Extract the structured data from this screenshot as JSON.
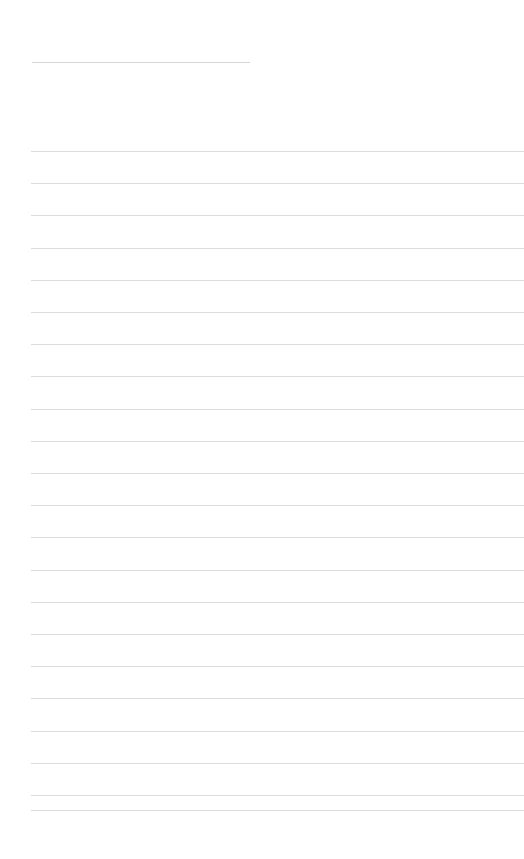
{
  "document": {
    "page_background": "#ffffff",
    "page_width": 524,
    "page_height": 859,
    "title_text": "",
    "body_text": "",
    "heading_rule": {
      "name": "heading-underline-rule",
      "x": 32,
      "y": 62,
      "width": 218,
      "color": "#d4d6da",
      "thickness": 1
    },
    "body_rules": {
      "name": "body-ruled-lines",
      "count": 22,
      "x_start": 31,
      "x_end": 524,
      "first_y": 151,
      "spacing": 32.2,
      "color": "#dadcdf",
      "thickness": 1,
      "y_positions": [
        151,
        183.2,
        215.4,
        247.6,
        279.8,
        312,
        344.2,
        376.4,
        408.6,
        440.8,
        473,
        505.2,
        537.4,
        569.6,
        601.8,
        634,
        666.2,
        698.4,
        730.6,
        762.8,
        795,
        810
      ]
    }
  }
}
